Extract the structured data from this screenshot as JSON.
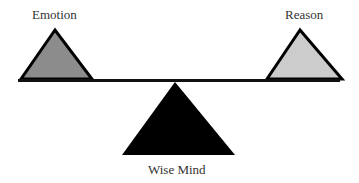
{
  "diagram": {
    "type": "balance-scale",
    "left": {
      "label": "Emotion",
      "fill": "#8c8c8c"
    },
    "right": {
      "label": "Reason",
      "fill": "#cccccc"
    },
    "fulcrum": {
      "label": "Wise Mind",
      "fill": "#000000"
    },
    "beam_color": "#111111"
  }
}
